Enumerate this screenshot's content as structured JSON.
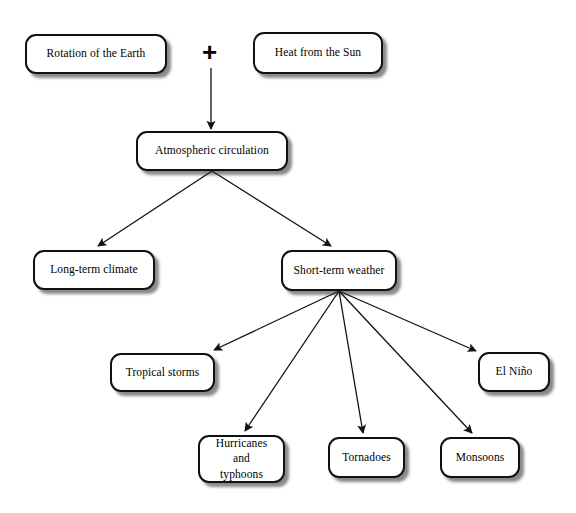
{
  "diagram": {
    "background_color": "#ffffff",
    "node_fill_color": "#ffffff",
    "node_border_color": "#111111",
    "connector_color": "#111111",
    "operator_symbol": "+",
    "nodes": [
      {
        "id": "rotation",
        "label": "Rotation of the Earth",
        "x": 25,
        "y": 34,
        "w": 142,
        "h": 40
      },
      {
        "id": "heat",
        "label": "Heat from the Sun",
        "x": 253,
        "y": 32,
        "w": 130,
        "h": 42
      },
      {
        "id": "atmospheric",
        "label": "Atmospheric circulation",
        "x": 136,
        "y": 131,
        "w": 152,
        "h": 40
      },
      {
        "id": "longterm",
        "label": "Long-term climate",
        "x": 33,
        "y": 250,
        "w": 122,
        "h": 40
      },
      {
        "id": "shortterm",
        "label": "Short-term weather",
        "x": 281,
        "y": 250,
        "w": 116,
        "h": 41
      },
      {
        "id": "tropical",
        "label": "Tropical storms",
        "x": 110,
        "y": 353,
        "w": 105,
        "h": 39
      },
      {
        "id": "elnino",
        "label": "El Niño",
        "x": 478,
        "y": 352,
        "w": 72,
        "h": 40
      },
      {
        "id": "hurricanes",
        "label": "Hurricanes and\ntyphoons",
        "x": 198,
        "y": 435,
        "w": 87,
        "h": 48
      },
      {
        "id": "tornadoes",
        "label": "Tornadoes",
        "x": 328,
        "y": 437,
        "w": 77,
        "h": 41
      },
      {
        "id": "monsoons",
        "label": "Monsoons",
        "x": 440,
        "y": 437,
        "w": 80,
        "h": 41
      }
    ],
    "operator": {
      "symbol": "+",
      "x": 211,
      "y": 53
    },
    "connectors": [
      {
        "id": "plus-to-atmospheric",
        "from": "operator",
        "to": "atmospheric",
        "x1": 211,
        "y1": 68,
        "x2": 211,
        "y2": 129
      },
      {
        "id": "atmospheric-to-longterm",
        "from": "atmospheric",
        "to": "longterm",
        "x1": 212,
        "y1": 171,
        "x2": 98,
        "y2": 246
      },
      {
        "id": "atmospheric-to-shortterm",
        "from": "atmospheric",
        "to": "shortterm",
        "x1": 212,
        "y1": 171,
        "x2": 331,
        "y2": 246
      },
      {
        "id": "shortterm-to-tropical",
        "from": "shortterm",
        "to": "tropical",
        "x1": 339,
        "y1": 291,
        "x2": 214,
        "y2": 350
      },
      {
        "id": "shortterm-to-hurricanes",
        "from": "shortterm",
        "to": "hurricanes",
        "x1": 339,
        "y1": 291,
        "x2": 245,
        "y2": 431
      },
      {
        "id": "shortterm-to-tornadoes",
        "from": "shortterm",
        "to": "tornadoes",
        "x1": 339,
        "y1": 291,
        "x2": 363,
        "y2": 433
      },
      {
        "id": "shortterm-to-monsoons",
        "from": "shortterm",
        "to": "monsoons",
        "x1": 339,
        "y1": 291,
        "x2": 472,
        "y2": 433
      },
      {
        "id": "shortterm-to-elnino",
        "from": "shortterm",
        "to": "elnino",
        "x1": 339,
        "y1": 291,
        "x2": 476,
        "y2": 351
      }
    ]
  }
}
